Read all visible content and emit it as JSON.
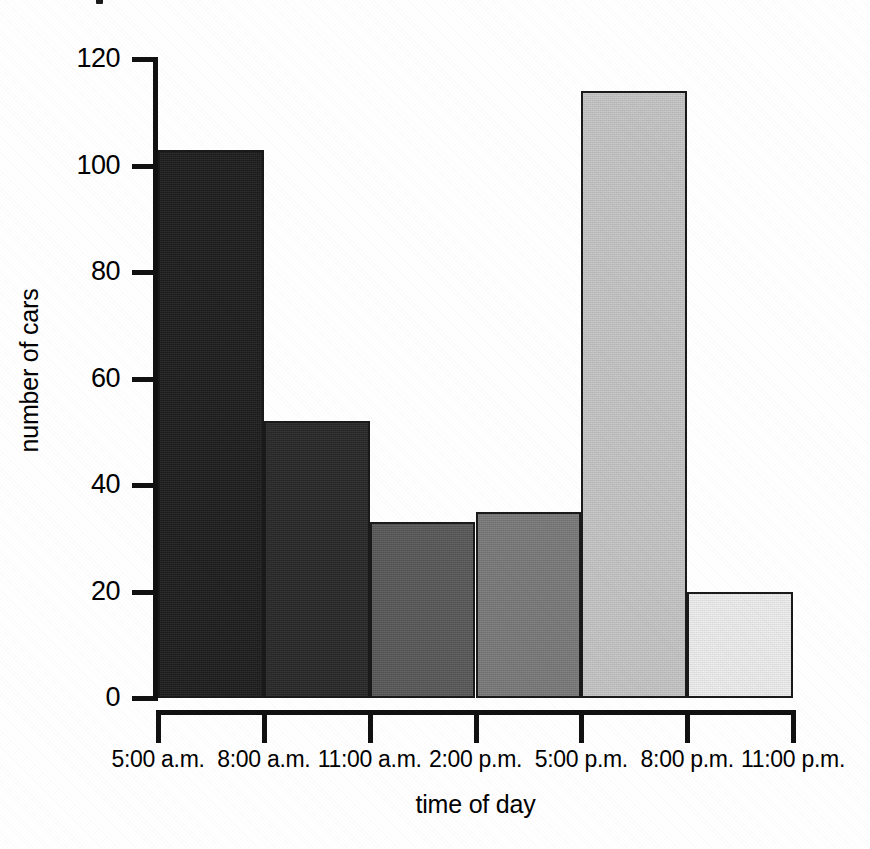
{
  "figure": {
    "title_remnant_present": true,
    "background_color": "#ffffff",
    "ink_color": "#111111"
  },
  "chart_data": {
    "type": "bar",
    "title": "",
    "xlabel": "time of day",
    "ylabel": "number of cars",
    "categories": [
      "5:00 a.m. - 8:00 a.m.",
      "8:00 a.m. - 11:00 a.m.",
      "11:00 a.m. - 2:00 p.m.",
      "2:00 p.m. - 5:00 p.m.",
      "5:00 p.m. - 8:00 p.m.",
      "8:00 p.m. - 11:00 p.m."
    ],
    "values": [
      103,
      52,
      33,
      35,
      114,
      20
    ],
    "bar_colors": [
      "#1d1d1d",
      "#282828",
      "#595959",
      "#7a7a7a",
      "#c6c6c6",
      "#efefef"
    ],
    "bar_border_color": "#1a1a1a",
    "ylim": [
      0,
      120
    ],
    "ytick_values": [
      0,
      20,
      40,
      60,
      80,
      100,
      120
    ],
    "ytick_labels": [
      "0",
      "20",
      "40",
      "60",
      "80",
      "100",
      "120"
    ],
    "xtick_labels": [
      "5:00 a.m.",
      "8:00 a.m.",
      "11:00 a.m.",
      "2:00 p.m.",
      "5:00 p.m.",
      "8:00 p.m.",
      "11:00 p.m."
    ],
    "grid": false,
    "legend": false,
    "legend_position": "none",
    "bar_gap": 0,
    "annotations": []
  }
}
